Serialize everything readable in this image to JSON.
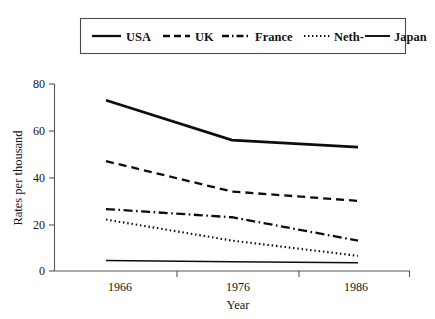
{
  "chart_data": {
    "type": "line",
    "title": "",
    "xlabel": "Year",
    "ylabel": "Rates per thousand",
    "x": [
      1966,
      1976,
      1986
    ],
    "xticklabels": [
      "1966",
      "1976",
      "1986"
    ],
    "yticks": [
      0,
      20,
      40,
      60,
      80
    ],
    "yticklabels": [
      "0",
      "20",
      "40",
      "60",
      "80"
    ],
    "ylim": [
      0,
      80
    ],
    "grid": false,
    "legend_position": "top",
    "series": [
      {
        "name": "USA",
        "style": "solid-thick",
        "values": [
          73,
          56,
          53
        ]
      },
      {
        "name": "UK",
        "style": "dashed",
        "values": [
          47,
          34,
          30
        ]
      },
      {
        "name": "France",
        "style": "dash-dot",
        "values": [
          26.5,
          23,
          13
        ]
      },
      {
        "name": "Neth-",
        "style": "dotted",
        "values": [
          22,
          13,
          6.5
        ]
      },
      {
        "name": "Japan",
        "style": "solid-thin",
        "values": [
          4.5,
          4,
          3.5
        ]
      }
    ]
  },
  "legend": {
    "items": [
      {
        "label": "USA",
        "sample": "solid-thick"
      },
      {
        "label": "UK",
        "sample": "dashed"
      },
      {
        "label": "France",
        "sample": "dash-dot"
      },
      {
        "label": "Neth-",
        "sample": "dotted"
      },
      {
        "label": "Japan",
        "sample": "solid-thin"
      }
    ]
  },
  "axes": {
    "y_title": "Rates per thousand",
    "x_title": "Year",
    "y_tick_0": "0",
    "y_tick_1": "20",
    "y_tick_2": "40",
    "y_tick_3": "60",
    "y_tick_4": "80",
    "x_tick_0": "1966",
    "x_tick_1": "1976",
    "x_tick_2": "1986"
  },
  "colors": {
    "ink": "#0d0d0d",
    "axis": "#555555",
    "background": "#ffffff"
  }
}
